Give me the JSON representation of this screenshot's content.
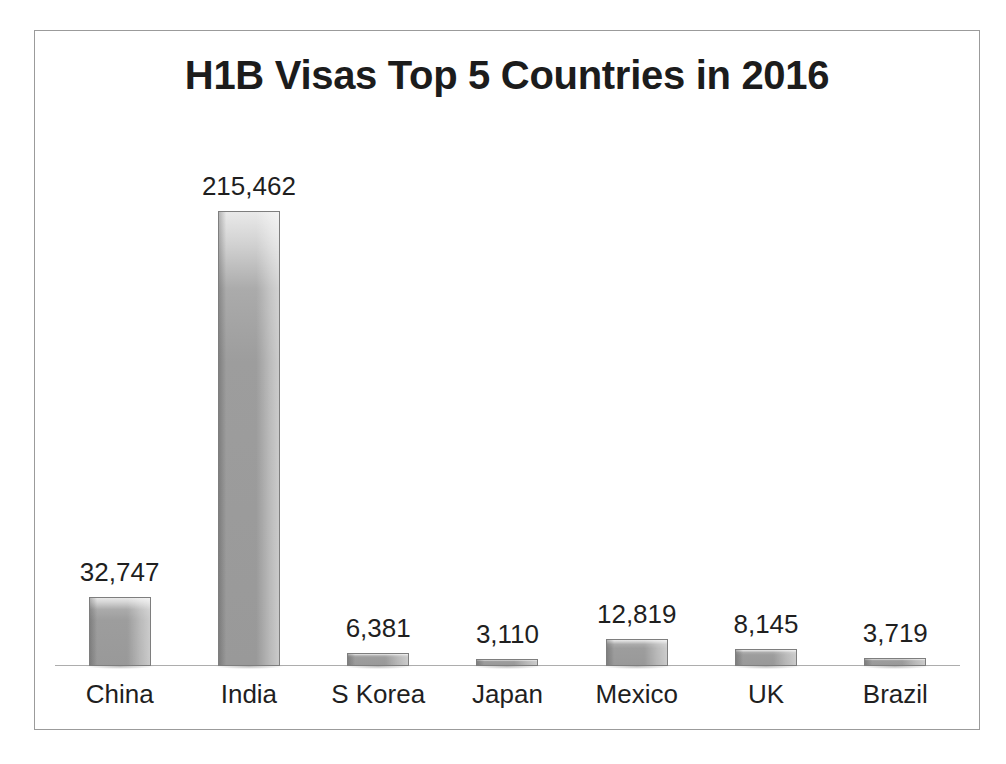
{
  "chart_data": {
    "type": "bar",
    "title": "H1B Visas Top 5 Countries in 2016",
    "xlabel": "",
    "ylabel": "",
    "categories": [
      "China",
      "India",
      "S Korea",
      "Japan",
      "Mexico",
      "UK",
      "Brazil"
    ],
    "values": [
      32747,
      215462,
      6381,
      3110,
      12819,
      8145,
      3719
    ],
    "value_labels": [
      "32,747",
      "215,462",
      "6,381",
      "3,110",
      "12,819",
      "8,145",
      "3,719"
    ],
    "ylim": [
      0,
      215462
    ],
    "grid": false,
    "legend": false,
    "axis_visible": true,
    "data_labels_shown": true,
    "colors": {
      "bar_fill": "#999999",
      "bar_highlight": "#e9e9e9",
      "bar_border": "#7e7e7e",
      "axis_line": "#adadad",
      "text": "#1f1f1f",
      "frame_border": "#9b9b9b",
      "background": "#ffffff"
    }
  },
  "frame": {
    "title": "H1B Visas Top 5 Countries in 2016"
  }
}
